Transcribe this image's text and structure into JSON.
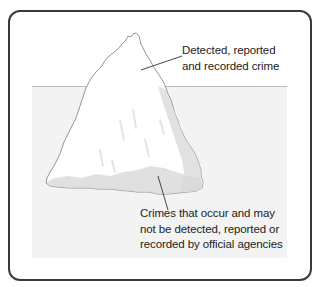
{
  "diagram": {
    "type": "iceberg-metaphor",
    "colors": {
      "frame_border": "#3a3a3a",
      "water": "#f3f3f3",
      "waterline": "#bdbdbd",
      "iceberg_light": "#ffffff",
      "iceberg_shade": "#e2e2e2",
      "iceberg_shade_dark": "#d2d2d2",
      "outline": "#8a8a8a",
      "text": "#222222"
    },
    "labels": {
      "above_water": {
        "lines": [
          "Detected, reported",
          "and recorded crime"
        ]
      },
      "below_water": {
        "lines": [
          "Crimes that occur and may",
          "not be detected, reported or",
          "recorded by official agencies"
        ]
      }
    }
  }
}
